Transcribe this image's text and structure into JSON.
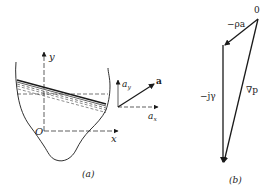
{
  "figure": {
    "panel_a": {
      "caption": "(a)",
      "axis_y_label": "y",
      "axis_x_label": "x",
      "origin_label": "O",
      "accel_vector_label": "a",
      "accel_y_label": "a",
      "accel_y_sub": "y",
      "accel_x_label": "a",
      "accel_x_sub": "x"
    },
    "panel_b": {
      "caption": "(b)",
      "origin_label": "0",
      "vector_rho_a_label": "−ρa",
      "vector_j_gamma_label": "−jγ",
      "vector_grad_p_label": "∇p"
    },
    "colors": {
      "ink": "#1a1a1a",
      "background": "#ffffff"
    }
  }
}
